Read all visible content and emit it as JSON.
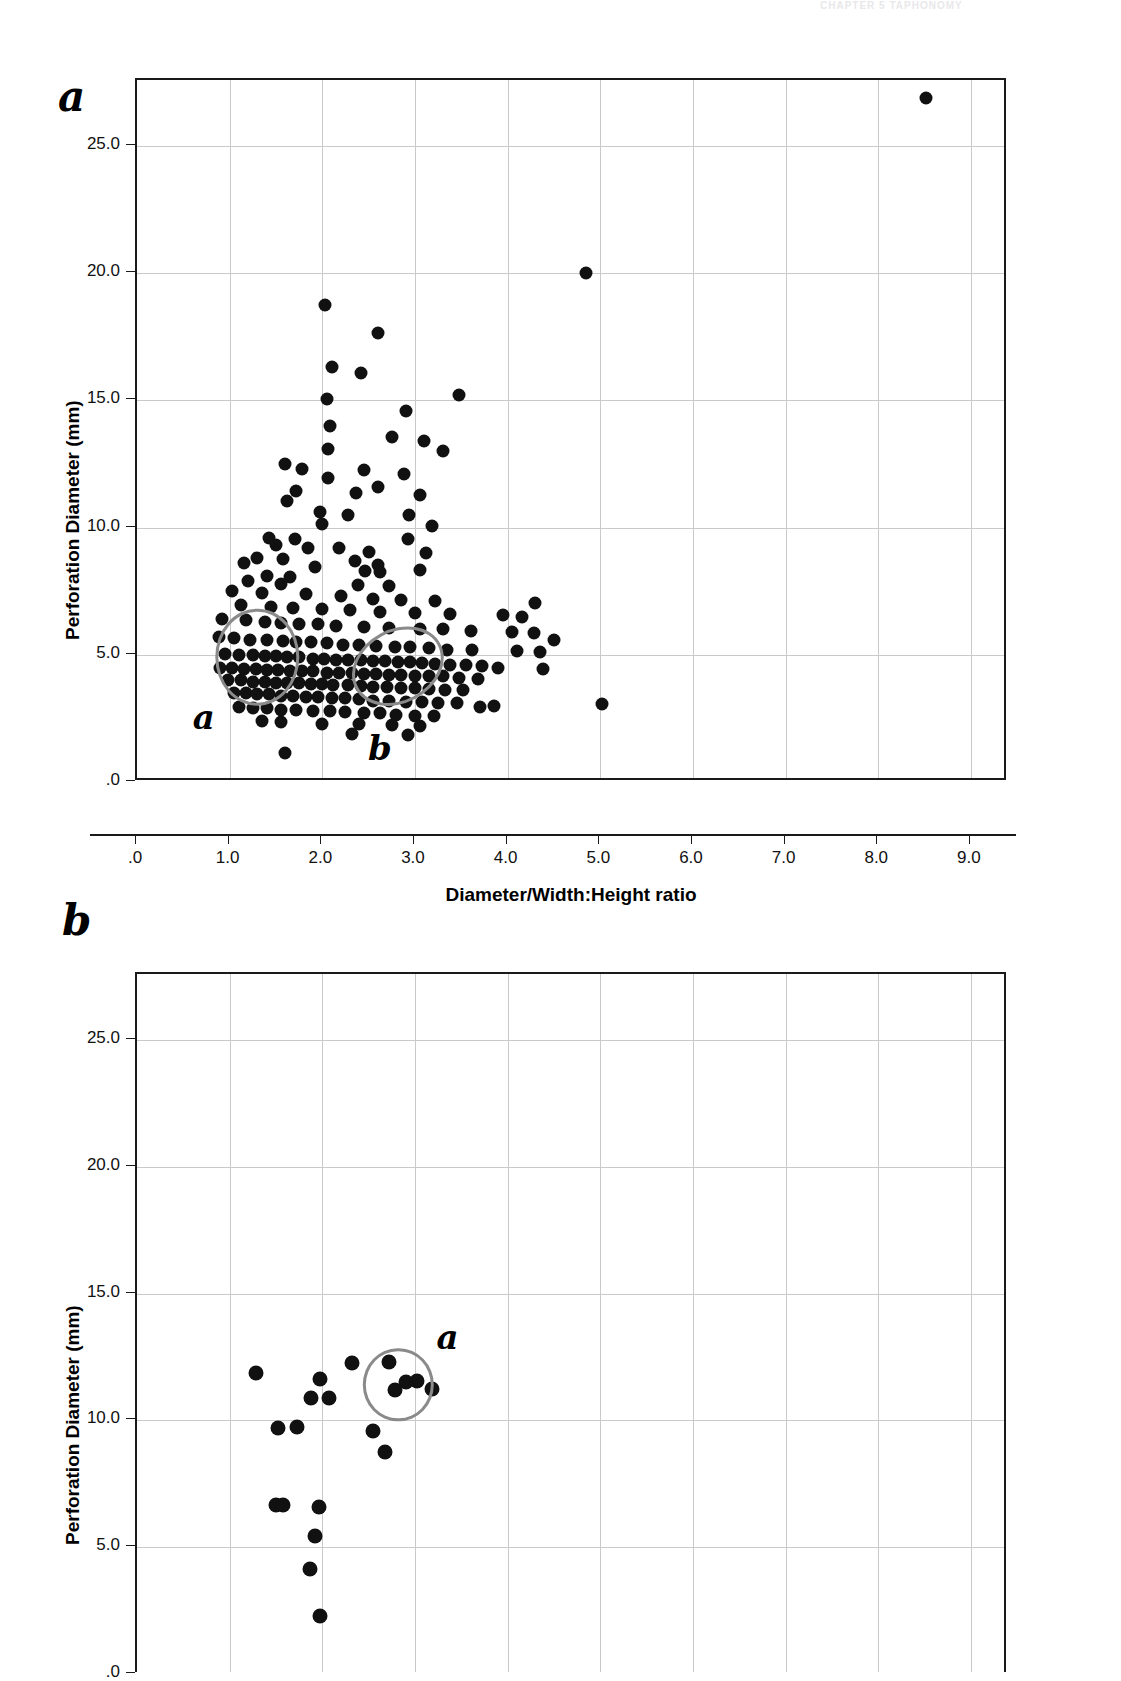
{
  "page": {
    "header_text": "CHAPTER 5   TAPHONOMY"
  },
  "figure": {
    "panels": [
      {
        "id": "a",
        "letter": "a",
        "axis_title_x": "Diameter/Width:Height ratio",
        "axis_title_y": "Perforation Diameter (mm)",
        "xticks": [
          ".0",
          "1.0",
          "2.0",
          "3.0",
          "4.0",
          "5.0",
          "6.0",
          "7.0",
          "8.0",
          "9.0"
        ],
        "yticks": [
          ".0",
          "5.0",
          "10.0",
          "15.0",
          "20.0",
          "25.0"
        ],
        "annotations": [
          {
            "label": "a",
            "cx": 1.3,
            "cy": 4.9,
            "rx": 0.45,
            "ry": 1.9,
            "rot": 0
          },
          {
            "label": "b",
            "cx": 2.82,
            "cy": 4.55,
            "rx": 0.52,
            "ry": 1.45,
            "rot": -28
          }
        ]
      },
      {
        "id": "b",
        "letter": "b",
        "axis_title_y": "Perforation Diameter (mm)",
        "yticks": [
          ".0",
          "5.0",
          "10.0",
          "15.0",
          "20.0",
          "25.0"
        ],
        "annotations": [
          {
            "label": "a",
            "cx": 2.82,
            "cy": 11.4,
            "rx": 0.38,
            "ry": 1.45,
            "rot": 0
          }
        ]
      }
    ]
  },
  "chart_data": [
    {
      "type": "scatter",
      "panel": "a",
      "title": "",
      "xlabel": "Diameter/Width:Height ratio",
      "ylabel": "Perforation Diameter (mm)",
      "xlim": [
        0,
        9.4
      ],
      "ylim": [
        0,
        27.6
      ],
      "xticks": [
        0,
        1,
        2,
        3,
        4,
        5,
        6,
        7,
        8,
        9
      ],
      "yticks": [
        0,
        5,
        10,
        15,
        20,
        25
      ],
      "grid": true,
      "legend": "none",
      "marker_color": "#111111",
      "annotation_color": "#8a8a8a",
      "points": [
        [
          8.52,
          26.9
        ],
        [
          4.85,
          20.0
        ],
        [
          2.03,
          18.75
        ],
        [
          2.6,
          17.65
        ],
        [
          2.1,
          16.3
        ],
        [
          2.42,
          16.1
        ],
        [
          3.48,
          15.2
        ],
        [
          2.05,
          15.05
        ],
        [
          2.9,
          14.6
        ],
        [
          2.08,
          14.0
        ],
        [
          2.75,
          13.55
        ],
        [
          3.1,
          13.4
        ],
        [
          2.06,
          13.1
        ],
        [
          3.3,
          13.0
        ],
        [
          1.6,
          12.5
        ],
        [
          1.78,
          12.3
        ],
        [
          2.45,
          12.25
        ],
        [
          2.88,
          12.1
        ],
        [
          2.06,
          11.95
        ],
        [
          2.6,
          11.6
        ],
        [
          1.72,
          11.45
        ],
        [
          2.36,
          11.35
        ],
        [
          3.05,
          11.3
        ],
        [
          1.62,
          11.05
        ],
        [
          1.98,
          10.6
        ],
        [
          2.28,
          10.5
        ],
        [
          2.94,
          10.5
        ],
        [
          2.0,
          10.15
        ],
        [
          3.18,
          10.05
        ],
        [
          1.42,
          9.6
        ],
        [
          1.7,
          9.55
        ],
        [
          2.92,
          9.55
        ],
        [
          1.5,
          9.3
        ],
        [
          1.85,
          9.2
        ],
        [
          2.18,
          9.2
        ],
        [
          2.5,
          9.05
        ],
        [
          3.12,
          9.0
        ],
        [
          1.3,
          8.8
        ],
        [
          1.58,
          8.75
        ],
        [
          2.35,
          8.7
        ],
        [
          2.6,
          8.55
        ],
        [
          1.15,
          8.6
        ],
        [
          1.92,
          8.45
        ],
        [
          2.46,
          8.3
        ],
        [
          2.62,
          8.25
        ],
        [
          3.05,
          8.35
        ],
        [
          1.4,
          8.1
        ],
        [
          1.65,
          8.05
        ],
        [
          1.2,
          7.9
        ],
        [
          1.55,
          7.8
        ],
        [
          2.38,
          7.75
        ],
        [
          2.72,
          7.7
        ],
        [
          1.02,
          7.5
        ],
        [
          1.35,
          7.45
        ],
        [
          1.82,
          7.4
        ],
        [
          2.2,
          7.3
        ],
        [
          2.55,
          7.2
        ],
        [
          2.85,
          7.15
        ],
        [
          3.22,
          7.1
        ],
        [
          4.3,
          7.05
        ],
        [
          1.12,
          6.95
        ],
        [
          1.45,
          6.9
        ],
        [
          1.68,
          6.85
        ],
        [
          2.0,
          6.8
        ],
        [
          2.3,
          6.75
        ],
        [
          2.62,
          6.7
        ],
        [
          3.0,
          6.65
        ],
        [
          3.38,
          6.6
        ],
        [
          3.95,
          6.55
        ],
        [
          4.15,
          6.5
        ],
        [
          0.92,
          6.4
        ],
        [
          1.18,
          6.35
        ],
        [
          1.38,
          6.3
        ],
        [
          1.55,
          6.25
        ],
        [
          1.75,
          6.2
        ],
        [
          1.95,
          6.2
        ],
        [
          2.15,
          6.15
        ],
        [
          2.45,
          6.1
        ],
        [
          2.72,
          6.05
        ],
        [
          3.05,
          6.0
        ],
        [
          3.3,
          6.0
        ],
        [
          3.6,
          5.95
        ],
        [
          4.05,
          5.9
        ],
        [
          4.28,
          5.85
        ],
        [
          0.88,
          5.7
        ],
        [
          1.05,
          5.65
        ],
        [
          1.22,
          5.6
        ],
        [
          1.4,
          5.6
        ],
        [
          1.58,
          5.55
        ],
        [
          1.72,
          5.5
        ],
        [
          1.88,
          5.5
        ],
        [
          2.05,
          5.45
        ],
        [
          2.22,
          5.4
        ],
        [
          2.4,
          5.4
        ],
        [
          2.58,
          5.35
        ],
        [
          2.78,
          5.3
        ],
        [
          2.95,
          5.3
        ],
        [
          3.15,
          5.25
        ],
        [
          3.35,
          5.2
        ],
        [
          3.62,
          5.2
        ],
        [
          4.1,
          5.15
        ],
        [
          4.35,
          5.1
        ],
        [
          0.95,
          5.05
        ],
        [
          1.1,
          5.0
        ],
        [
          1.25,
          5.0
        ],
        [
          1.38,
          4.95
        ],
        [
          1.5,
          4.95
        ],
        [
          1.62,
          4.9
        ],
        [
          1.75,
          4.9
        ],
        [
          1.9,
          4.85
        ],
        [
          2.02,
          4.85
        ],
        [
          2.15,
          4.8
        ],
        [
          2.28,
          4.8
        ],
        [
          2.42,
          4.78
        ],
        [
          2.55,
          4.75
        ],
        [
          2.68,
          4.75
        ],
        [
          2.82,
          4.7
        ],
        [
          2.95,
          4.7
        ],
        [
          3.08,
          4.68
        ],
        [
          3.22,
          4.65
        ],
        [
          3.38,
          4.6
        ],
        [
          3.55,
          4.6
        ],
        [
          3.72,
          4.55
        ],
        [
          3.9,
          4.5
        ],
        [
          0.9,
          4.5
        ],
        [
          1.02,
          4.48
        ],
        [
          1.15,
          4.45
        ],
        [
          1.28,
          4.45
        ],
        [
          1.4,
          4.4
        ],
        [
          1.52,
          4.4
        ],
        [
          1.65,
          4.38
        ],
        [
          1.78,
          4.35
        ],
        [
          1.9,
          4.35
        ],
        [
          2.05,
          4.3
        ],
        [
          2.18,
          4.3
        ],
        [
          2.32,
          4.28
        ],
        [
          2.45,
          4.25
        ],
        [
          2.58,
          4.25
        ],
        [
          2.72,
          4.2
        ],
        [
          2.85,
          4.2
        ],
        [
          3.0,
          4.18
        ],
        [
          3.15,
          4.15
        ],
        [
          3.3,
          4.15
        ],
        [
          3.48,
          4.1
        ],
        [
          3.68,
          4.05
        ],
        [
          0.98,
          4.0
        ],
        [
          1.12,
          4.0
        ],
        [
          1.25,
          3.95
        ],
        [
          1.38,
          3.95
        ],
        [
          1.5,
          3.9
        ],
        [
          1.62,
          3.9
        ],
        [
          1.75,
          3.88
        ],
        [
          1.88,
          3.85
        ],
        [
          2.0,
          3.85
        ],
        [
          2.12,
          3.8
        ],
        [
          2.28,
          3.8
        ],
        [
          2.42,
          3.78
        ],
        [
          2.55,
          3.75
        ],
        [
          2.7,
          3.75
        ],
        [
          2.85,
          3.7
        ],
        [
          3.0,
          3.7
        ],
        [
          3.15,
          3.65
        ],
        [
          3.32,
          3.6
        ],
        [
          3.52,
          3.6
        ],
        [
          1.05,
          3.5
        ],
        [
          1.18,
          3.48
        ],
        [
          1.3,
          3.45
        ],
        [
          1.42,
          3.45
        ],
        [
          1.55,
          3.4
        ],
        [
          1.68,
          3.4
        ],
        [
          1.82,
          3.35
        ],
        [
          1.95,
          3.35
        ],
        [
          2.1,
          3.3
        ],
        [
          2.25,
          3.3
        ],
        [
          2.4,
          3.25
        ],
        [
          2.55,
          3.2
        ],
        [
          2.72,
          3.2
        ],
        [
          2.9,
          3.15
        ],
        [
          3.08,
          3.15
        ],
        [
          3.25,
          3.1
        ],
        [
          3.45,
          3.1
        ],
        [
          5.02,
          3.05
        ],
        [
          1.1,
          2.95
        ],
        [
          1.25,
          2.9
        ],
        [
          1.4,
          2.9
        ],
        [
          1.55,
          2.85
        ],
        [
          1.72,
          2.85
        ],
        [
          1.9,
          2.8
        ],
        [
          2.08,
          2.8
        ],
        [
          2.25,
          2.75
        ],
        [
          2.45,
          2.7
        ],
        [
          2.62,
          2.7
        ],
        [
          2.8,
          2.65
        ],
        [
          3.0,
          2.6
        ],
        [
          3.2,
          2.6
        ],
        [
          1.35,
          2.4
        ],
        [
          1.55,
          2.35
        ],
        [
          2.0,
          2.3
        ],
        [
          2.4,
          2.3
        ],
        [
          2.75,
          2.25
        ],
        [
          3.05,
          2.2
        ],
        [
          1.6,
          1.15
        ],
        [
          2.32,
          1.9
        ],
        [
          2.92,
          1.85
        ],
        [
          4.5,
          5.6
        ],
        [
          4.38,
          4.45
        ],
        [
          3.85,
          3.0
        ],
        [
          3.7,
          2.95
        ]
      ]
    },
    {
      "type": "scatter",
      "panel": "b",
      "title": "",
      "xlabel": "",
      "ylabel": "Perforation Diameter (mm)",
      "xlim": [
        0,
        9.4
      ],
      "ylim": [
        0,
        27.6
      ],
      "yticks": [
        0,
        5,
        10,
        15,
        20,
        25
      ],
      "grid": true,
      "legend": "none",
      "marker_color": "#111111",
      "annotation_color": "#8a8a8a",
      "points": [
        [
          1.28,
          11.85
        ],
        [
          1.97,
          11.65
        ],
        [
          2.32,
          12.25
        ],
        [
          2.72,
          12.3
        ],
        [
          1.88,
          10.9
        ],
        [
          2.07,
          10.9
        ],
        [
          2.9,
          11.5
        ],
        [
          3.02,
          11.55
        ],
        [
          3.18,
          11.25
        ],
        [
          2.78,
          11.2
        ],
        [
          1.52,
          9.7
        ],
        [
          1.73,
          9.75
        ],
        [
          2.55,
          9.6
        ],
        [
          2.68,
          8.75
        ],
        [
          1.5,
          6.65
        ],
        [
          1.58,
          6.65
        ],
        [
          1.96,
          6.6
        ],
        [
          1.92,
          5.45
        ],
        [
          1.87,
          4.15
        ],
        [
          1.98,
          2.3
        ]
      ]
    }
  ]
}
